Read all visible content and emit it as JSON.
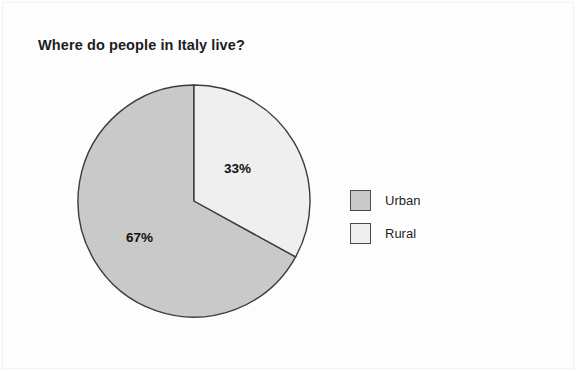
{
  "chart_data": {
    "type": "pie",
    "title": "Where do people in Italy live?",
    "categories": [
      "Urban",
      "Rural"
    ],
    "values": [
      67,
      33
    ],
    "value_labels": [
      "67%",
      "33%"
    ],
    "unit": "%",
    "total": 100,
    "start_angle_deg": 0,
    "direction": "clockwise",
    "legend_position": "right",
    "grid": false,
    "xlabel": "",
    "ylabel": "",
    "slices": [
      {
        "name": "Urban",
        "value": 67,
        "label": "67%",
        "color": "#c9c9c9",
        "stroke": "#3c3c3c",
        "start_deg": 118.8,
        "end_deg": 360.0
      },
      {
        "name": "Rural",
        "value": 33,
        "label": "33%",
        "color": "#efefef",
        "stroke": "#3c3c3c",
        "start_deg": 0.0,
        "end_deg": 118.8
      }
    ]
  },
  "legend": {
    "items": [
      {
        "label": "Urban",
        "color": "#c9c9c9"
      },
      {
        "label": "Rural",
        "color": "#efefef"
      }
    ]
  },
  "colors": {
    "urban": "#c9c9c9",
    "rural": "#efefef",
    "outline": "#3c3c3c",
    "text": "#1c1c1c",
    "background": "#fdfdfd"
  }
}
